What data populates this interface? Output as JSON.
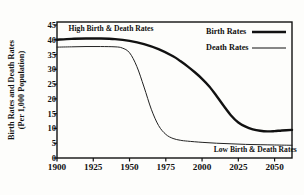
{
  "chart_data": {
    "type": "line",
    "title": "",
    "xlabel": "",
    "ylabel_line1": "Birth Rates and Death Rates",
    "ylabel_line2": "(Per 1,000 Population)",
    "xlim": [
      1900,
      2062
    ],
    "ylim": [
      0,
      46
    ],
    "yticks": [
      0,
      5,
      10,
      15,
      20,
      25,
      30,
      35,
      40,
      45
    ],
    "ytick_labels": [
      "0",
      "5",
      "10",
      "15",
      "20",
      "25",
      "30",
      "35",
      "40",
      "45"
    ],
    "xticks": [
      1900,
      1925,
      1950,
      1975,
      2000,
      2025,
      2050
    ],
    "xtick_labels": [
      "1900",
      "1925",
      "1950",
      "1975",
      "2000",
      "2025",
      "2050"
    ],
    "grid": false,
    "legend_position": "top-right",
    "series": [
      {
        "name": "Birth Rates",
        "color": "#111111",
        "line_width": 2.4,
        "x": [
          1900,
          1910,
          1920,
          1930,
          1940,
          1950,
          1960,
          1970,
          1980,
          1985,
          1990,
          1995,
          2000,
          2005,
          2010,
          2015,
          2020,
          2025,
          2030,
          2035,
          2040,
          2045,
          2050,
          2055,
          2062
        ],
        "values": [
          40.0,
          40.3,
          40.4,
          40.4,
          40.2,
          39.6,
          38.5,
          36.8,
          34.4,
          32.8,
          31.0,
          29.0,
          26.8,
          24.2,
          21.0,
          17.6,
          14.4,
          12.0,
          10.6,
          9.7,
          9.2,
          9.0,
          9.1,
          9.3,
          9.5
        ]
      },
      {
        "name": "Death Rates",
        "color": "#222222",
        "line_width": 1.0,
        "x": [
          1900,
          1910,
          1920,
          1930,
          1940,
          1945,
          1950,
          1955,
          1960,
          1965,
          1970,
          1975,
          1980,
          1985,
          1990,
          2000,
          2010,
          2020,
          2030,
          2040,
          2050,
          2062
        ],
        "values": [
          37.5,
          37.6,
          37.7,
          37.7,
          37.6,
          37.2,
          35.6,
          31.0,
          24.0,
          16.5,
          11.0,
          8.0,
          6.6,
          6.0,
          5.7,
          5.3,
          5.0,
          4.8,
          4.6,
          4.5,
          4.4,
          4.3
        ]
      }
    ],
    "annotations": [
      {
        "text": "High Birth & Death Rates",
        "x": 1908,
        "y": 43.5
      },
      {
        "text": "Low Birth & Death Rates",
        "x": 2008,
        "y": 2.6
      }
    ],
    "legend": [
      {
        "label": "Birth Rates",
        "style": "thick-solid"
      },
      {
        "label": "Death Rates",
        "style": "thin-solid"
      }
    ]
  }
}
